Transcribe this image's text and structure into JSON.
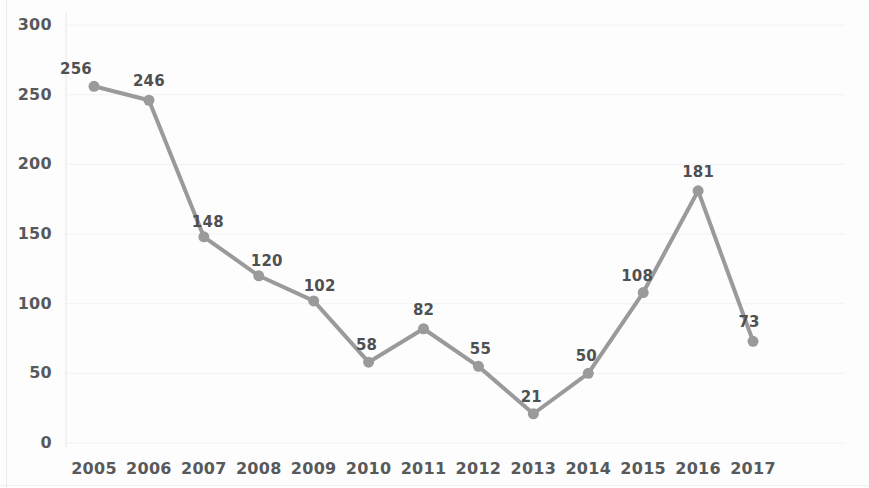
{
  "chart_data": {
    "type": "line",
    "title": "",
    "xlabel": "",
    "ylabel": "",
    "categories": [
      "2005",
      "2006",
      "2007",
      "2008",
      "2009",
      "2010",
      "2011",
      "2012",
      "2013",
      "2014",
      "2015",
      "2016",
      "2017"
    ],
    "values": [
      256,
      246,
      148,
      120,
      102,
      58,
      82,
      55,
      21,
      50,
      108,
      181,
      73
    ],
    "data_labels": [
      "256",
      "246",
      "148",
      "120",
      "102",
      "58",
      "82",
      "55",
      "21",
      "50",
      "108",
      "181",
      "73"
    ],
    "ylim": [
      0,
      300
    ],
    "yticks": [
      0,
      50,
      100,
      150,
      200,
      250,
      300
    ],
    "ytick_labels": [
      "0",
      "50",
      "100",
      "150",
      "200",
      "250",
      "300"
    ],
    "xtick_labels": [
      "2005",
      "2006",
      "2007",
      "2008",
      "2009",
      "2010",
      "2011",
      "2012",
      "2013",
      "2014",
      "2015",
      "2016",
      "2017"
    ],
    "grid": true,
    "grid_axis": "y",
    "legend": null,
    "legend_position": "none",
    "series": [
      {
        "name": "",
        "values": [
          256,
          246,
          148,
          120,
          102,
          58,
          82,
          55,
          21,
          50,
          108,
          181,
          73
        ]
      }
    ],
    "colors": {
      "line": "#9a9a9a",
      "marker": "#9a9a9a",
      "gridline": "#f2f2f2",
      "tick_text": "#58595b",
      "label_text": "#4f5052",
      "background": "#fdfdfd"
    },
    "label_offsets": [
      {
        "dx": -18,
        "dy": -26
      },
      {
        "dx": 0,
        "dy": -28
      },
      {
        "dx": 4,
        "dy": -24
      },
      {
        "dx": 8,
        "dy": -24
      },
      {
        "dx": 6,
        "dy": -24
      },
      {
        "dx": -2,
        "dy": -26
      },
      {
        "dx": 0,
        "dy": -28
      },
      {
        "dx": 2,
        "dy": -26
      },
      {
        "dx": -2,
        "dy": -26
      },
      {
        "dx": -2,
        "dy": -26
      },
      {
        "dx": -6,
        "dy": -26
      },
      {
        "dx": 0,
        "dy": -28
      },
      {
        "dx": -4,
        "dy": -28
      }
    ]
  }
}
